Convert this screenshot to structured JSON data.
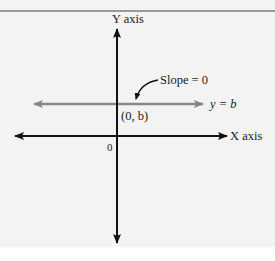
{
  "diagram": {
    "y_axis_label": "Y axis",
    "x_axis_label": "X axis",
    "origin_label": "0",
    "intercept_label": "(0, b)",
    "line_label": "y = b",
    "annotation": "Slope = 0"
  },
  "colors": {
    "axis": "#111111",
    "horizontal_line": "#888888",
    "background": "#f3f3f3",
    "rule": "#9a9a9a"
  }
}
